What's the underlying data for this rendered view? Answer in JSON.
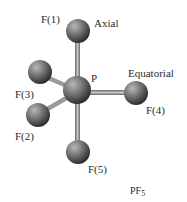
{
  "molecule": {
    "formula_main": "PF",
    "formula_sub": "5",
    "center_atom": "P",
    "atoms": [
      {
        "id": "F1",
        "label": "F(1)"
      },
      {
        "id": "F2",
        "label": "F(2)"
      },
      {
        "id": "F3",
        "label": "F(3)"
      },
      {
        "id": "F4",
        "label": "F(4)"
      },
      {
        "id": "F5",
        "label": "F(5)"
      }
    ],
    "annotations": {
      "axial": "Axial",
      "equatorial": "Equatorial"
    }
  },
  "colors": {
    "atom_highlight": "#a8a8a8",
    "atom_shadow": "#2e2e2e",
    "bond": "#8a8a8a",
    "text": "#2a2a2a"
  }
}
